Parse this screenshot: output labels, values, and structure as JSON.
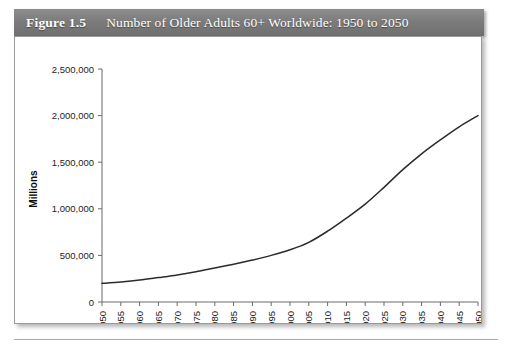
{
  "figure": {
    "number_label": "Figure 1.5",
    "title": "Number of Older Adults 60+ Worldwide: 1950 to 2050"
  },
  "chart_data": {
    "type": "line",
    "title": "Number of Older Adults 60+ Worldwide: 1950 to 2050",
    "xlabel": "",
    "ylabel": "Millions",
    "x": [
      1950,
      1955,
      1960,
      1965,
      1970,
      1975,
      1980,
      1985,
      1990,
      1995,
      2000,
      2005,
      2010,
      2015,
      2020,
      2025,
      2030,
      2035,
      2040,
      2045,
      2050
    ],
    "values": [
      200000,
      215000,
      235000,
      262000,
      290000,
      325000,
      365000,
      405000,
      450000,
      500000,
      560000,
      640000,
      760000,
      900000,
      1050000,
      1230000,
      1420000,
      1590000,
      1740000,
      1880000,
      2000000
    ],
    "xtick_labels": [
      "1950",
      "1955",
      "1960",
      "1965",
      "1970",
      "1975",
      "1980",
      "1985",
      "1990",
      "1995",
      "2000",
      "2005",
      "2010",
      "2015",
      "2020",
      "2025",
      "2030",
      "2035",
      "2040",
      "2045",
      "2050"
    ],
    "ytick_labels": [
      "0",
      "500,000",
      "1,000,000",
      "1,500,000",
      "2,000,000",
      "2,500,000"
    ],
    "ytick_values": [
      0,
      500000,
      1000000,
      1500000,
      2000000,
      2500000
    ],
    "ylim": [
      0,
      2500000
    ],
    "xlim": [
      1950,
      2050
    ],
    "grid": false,
    "legend": "none",
    "line_color": "#2b2b2b"
  },
  "colors": {
    "title_band": "#7c7c7c",
    "title_text": "#ffffff",
    "axis": "#6b6b6b",
    "line": "#2b2b2b",
    "panel_border": "#9a9a9a"
  }
}
